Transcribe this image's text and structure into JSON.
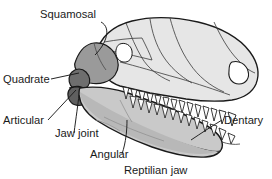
{
  "figure": {
    "title": "Reptilian jaw",
    "background_color": "#ffffff",
    "outline_color": "#1a1a1a",
    "text_color": "#1a1a1a"
  },
  "palette": {
    "cranium_fill": "#e2e2e2",
    "cranium_light": "#ededed",
    "lower_jaw_fill": "#c9c9c9",
    "squamosal_fill": "#9a9a9a",
    "quadrate_fill": "#6e6e6e",
    "articular_fill": "#5f5f5f",
    "tooth_fill": "#fbfbfb",
    "leader_color": "#1a1a1a"
  },
  "labels": [
    {
      "id": "squamosal",
      "text": "Squamosal",
      "x": 40,
      "y": 18,
      "anchor": "start",
      "target_x": 92,
      "target_y": 57
    },
    {
      "id": "quadrate",
      "text": "Quadrate",
      "x": 3,
      "y": 83,
      "anchor": "start",
      "target_x": 80,
      "target_y": 76
    },
    {
      "id": "articular",
      "text": "Articular",
      "x": 3,
      "y": 124,
      "anchor": "start",
      "target_x": 78,
      "target_y": 92
    },
    {
      "id": "jaw-joint",
      "text": "Jaw joint",
      "x": 55,
      "y": 137,
      "anchor": "start",
      "target_x": 79,
      "target_y": 95
    },
    {
      "id": "angular",
      "text": "Angular",
      "x": 90,
      "y": 158,
      "anchor": "start",
      "target_x": 126,
      "target_y": 120
    },
    {
      "id": "dentary",
      "text": "Dentary",
      "x": 224,
      "y": 124,
      "anchor": "start",
      "target_x": 192,
      "target_y": 141
    },
    {
      "id": "reptilian-jaw",
      "text": "Reptilian jaw",
      "x": 124,
      "y": 174,
      "anchor": "start",
      "target_x": null,
      "target_y": null
    }
  ],
  "bones": [
    {
      "id": "cranium",
      "name": "cranium",
      "shade": "light"
    },
    {
      "id": "squamosal",
      "name": "squamosal",
      "shade": "medium-dark"
    },
    {
      "id": "quadrate",
      "name": "quadrate",
      "shade": "dark"
    },
    {
      "id": "articular",
      "name": "articular",
      "shade": "dark"
    },
    {
      "id": "angular",
      "name": "angular",
      "shade": "medium"
    },
    {
      "id": "dentary",
      "name": "dentary",
      "shade": "medium"
    }
  ],
  "features": {
    "orbit": "eye-socket-opening",
    "naris": "nostril-opening",
    "upper_tooth_count": 14,
    "lower_tooth_count": 13
  }
}
